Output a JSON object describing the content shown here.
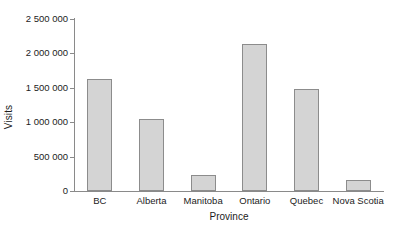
{
  "chart_data": {
    "type": "bar",
    "title": "",
    "subtitle": "",
    "xlabel": "Province",
    "ylabel": "Visits",
    "categories": [
      "BC",
      "Alberta",
      "Manitoba",
      "Ontario",
      "Quebec",
      "Nova Scotia"
    ],
    "values": [
      1635000,
      1046000,
      233000,
      2136000,
      1482000,
      165000
    ],
    "series": [
      {
        "name": "Visits",
        "values": [
          1635000,
          1046000,
          233000,
          2136000,
          1482000,
          165000
        ]
      }
    ],
    "ylim": [
      0,
      2500000
    ],
    "ytick_values": [
      0,
      500000,
      1000000,
      1500000,
      2000000,
      2500000
    ],
    "ytick_labels": [
      "0",
      "500 000",
      "1 000 000",
      "1 500 000",
      "2 000 000",
      "2 500 000"
    ],
    "grid": false,
    "legend": null,
    "legend_position": "none",
    "annotations": [],
    "colors": {
      "bar_fill": "#d4d4d4",
      "bar_border": "#8c8c8c",
      "axis": "#8a8a8a",
      "text": "#1c1c1c",
      "background": "#ffffff"
    }
  }
}
